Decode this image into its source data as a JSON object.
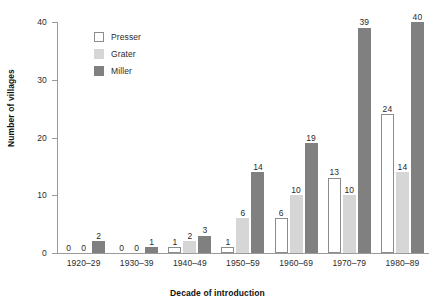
{
  "chart_data": {
    "type": "bar",
    "title": "",
    "xlabel": "Decade of introduction",
    "ylabel": "Number of villages",
    "categories": [
      "1920–29",
      "1930–39",
      "1940–49",
      "1950–59",
      "1960–69",
      "1970–79",
      "1980–89"
    ],
    "series": [
      {
        "name": "Presser",
        "color": "#ffffff",
        "values": [
          0,
          0,
          1,
          1,
          6,
          13,
          24
        ]
      },
      {
        "name": "Grater",
        "color": "#d6d6d6",
        "values": [
          0,
          0,
          2,
          6,
          10,
          10,
          14
        ]
      },
      {
        "name": "Miller",
        "color": "#808080",
        "values": [
          2,
          1,
          3,
          14,
          19,
          39,
          40
        ]
      }
    ],
    "ylim": [
      0,
      40
    ],
    "yticks": [
      0,
      10,
      20,
      30,
      40
    ],
    "ytick_labels": [
      "0",
      "10",
      "20",
      "30",
      "40"
    ],
    "grid": false,
    "legend_position": "upper-left-inside",
    "data_labels": true
  },
  "legend": {
    "items": [
      {
        "label": "Presser",
        "swatch": "presser"
      },
      {
        "label": "Grater",
        "swatch": "grater"
      },
      {
        "label": "Miller",
        "swatch": "miller"
      }
    ]
  }
}
